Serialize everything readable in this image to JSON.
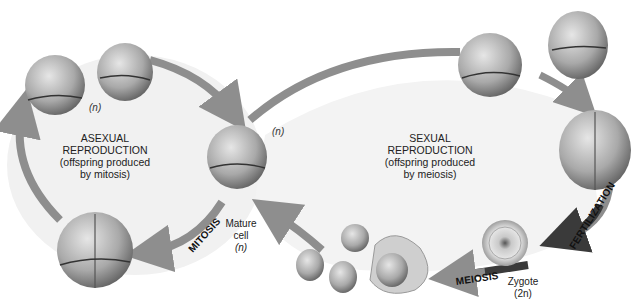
{
  "diagram": {
    "asexual": {
      "title_line1": "ASEXUAL",
      "title_line2": "REPRODUCTION",
      "sub_line1": "(offspring produced",
      "sub_line2": "by mitosis)",
      "ploidy_tag": "(n)"
    },
    "sexual": {
      "title_line1": "SEXUAL",
      "title_line2": "REPRODUCTION",
      "sub_line1": "(offspring produced",
      "sub_line2": "by meiosis)"
    },
    "mature_cell": {
      "line1": "Mature",
      "line2": "cell",
      "line3": "(n)",
      "ploidy_tag": "(n)"
    },
    "zygote": {
      "line1": "Zygote",
      "line2": "(2n)"
    },
    "processes": {
      "mitosis": "MITOSIS",
      "fertilization": "FERTILIZATION",
      "meiosis": "MEIOSIS"
    },
    "colors": {
      "arrow": "#8e8e8e",
      "arrow_dark": "#3a3a3a",
      "cell_light": "#d8d8d8",
      "cell_dark": "#6e6e6e",
      "field": "#f1f1f1"
    }
  }
}
